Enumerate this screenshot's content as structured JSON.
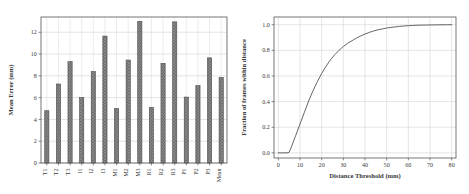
{
  "figure": {
    "panels": [
      "bar-chart-mean-error",
      "cdf-fraction-within-distance"
    ]
  },
  "chart_data": [
    {
      "type": "bar",
      "id": "mean-error-per-sequence",
      "title": "",
      "xlabel": "",
      "ylabel": "Mean Error (mm)",
      "categories": [
        "T1",
        "T2",
        "T3",
        "I1",
        "I2",
        "I3",
        "M1",
        "M2",
        "M3",
        "R1",
        "R2",
        "R3",
        "P1",
        "P2",
        "P3",
        "Mean"
      ],
      "values": [
        4.8,
        7.25,
        9.3,
        6.0,
        8.4,
        11.65,
        5.0,
        9.45,
        13.0,
        5.1,
        9.15,
        12.95,
        6.05,
        7.1,
        9.65,
        7.85
      ],
      "ylim": [
        0,
        13.4
      ],
      "yticks": [
        "0",
        "2",
        "4",
        "6",
        "8",
        "10",
        "12"
      ],
      "ytick_values": [
        0,
        2,
        4,
        6,
        8,
        10,
        12
      ],
      "grid": true,
      "legend": "none",
      "bar_color": "#6e6e6e",
      "bar_edge_color": "#4a4a4a",
      "bar_hatch": "cross-hatch",
      "tick_label_rotation": "90"
    },
    {
      "type": "line",
      "id": "fraction-of-frames-within-distance",
      "title": "",
      "xlabel": "Distance Threshold (mm)",
      "ylabel": "Fraction of frames within distance",
      "xlim": [
        -2,
        82
      ],
      "ylim": [
        -0.04,
        1.06
      ],
      "xticks": [
        "0",
        "10",
        "20",
        "30",
        "40",
        "50",
        "60",
        "70",
        "80"
      ],
      "xtick_values": [
        0,
        10,
        20,
        30,
        40,
        50,
        60,
        70,
        80
      ],
      "yticks": [
        "0.0",
        "0.2",
        "0.4",
        "0.6",
        "0.8",
        "1.0"
      ],
      "ytick_values": [
        0.0,
        0.2,
        0.4,
        0.6,
        0.8,
        1.0
      ],
      "grid": true,
      "legend": "none",
      "line_color": "#555555",
      "x": [
        0,
        2,
        4,
        5,
        6,
        8,
        10,
        12,
        14,
        16,
        18,
        20,
        22,
        24,
        26,
        28,
        30,
        32,
        34,
        36,
        38,
        40,
        42,
        44,
        46,
        48,
        50,
        52,
        54,
        56,
        58,
        60,
        62,
        64,
        66,
        68,
        70,
        72,
        74,
        76,
        78,
        80
      ],
      "y": [
        0.0,
        0.0,
        0.0,
        0.005,
        0.045,
        0.135,
        0.225,
        0.315,
        0.405,
        0.485,
        0.555,
        0.62,
        0.675,
        0.725,
        0.765,
        0.8,
        0.83,
        0.855,
        0.875,
        0.895,
        0.912,
        0.927,
        0.94,
        0.951,
        0.96,
        0.967,
        0.974,
        0.979,
        0.983,
        0.987,
        0.99,
        0.992,
        0.994,
        0.996,
        0.9965,
        0.997,
        0.998,
        0.9985,
        0.999,
        0.9993,
        0.9996,
        1.0
      ]
    }
  ]
}
